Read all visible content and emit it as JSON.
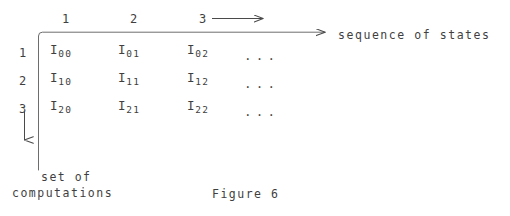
{
  "figure": {
    "caption": "Figure 6",
    "column_headers": [
      "1",
      "2",
      "3"
    ],
    "row_headers": [
      "1",
      "2",
      "3"
    ],
    "horizontal_axis_label": "sequence of states",
    "vertical_axis_label_line1": "set of",
    "vertical_axis_label_line2": "computations",
    "ellipsis": "...",
    "ink_color": "#3f3f3f",
    "matrix": {
      "symbol": "I",
      "rows": [
        [
          {
            "base": "I",
            "sub": "00"
          },
          {
            "base": "I",
            "sub": "01"
          },
          {
            "base": "I",
            "sub": "02"
          }
        ],
        [
          {
            "base": "I",
            "sub": "10"
          },
          {
            "base": "I",
            "sub": "11"
          },
          {
            "base": "I",
            "sub": "12"
          }
        ],
        [
          {
            "base": "I",
            "sub": "20"
          },
          {
            "base": "I",
            "sub": "21"
          },
          {
            "base": "I",
            "sub": "22"
          }
        ]
      ]
    },
    "arrows": {
      "top_continuation": "right-arrow",
      "horizontal_axis": "right-arrow",
      "vertical_axis": "down-arrow"
    }
  }
}
